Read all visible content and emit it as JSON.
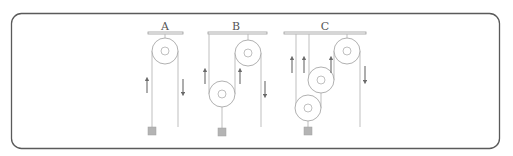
{
  "diagram": {
    "type": "pulley-systems",
    "systems": [
      {
        "id": "A",
        "label": "A",
        "pulleys": 1,
        "description": "single fixed pulley"
      },
      {
        "id": "B",
        "label": "B",
        "pulleys": 2,
        "description": "one fixed + one movable pulley"
      },
      {
        "id": "C",
        "label": "C",
        "pulleys": 3,
        "description": "one fixed + two movable pulleys"
      }
    ],
    "colors": {
      "frame": "#5a5a5a",
      "rope": "#b8b8b8",
      "weight": "#b4b4b4",
      "arrow": "#6a6a6a",
      "label": "#555555"
    }
  }
}
